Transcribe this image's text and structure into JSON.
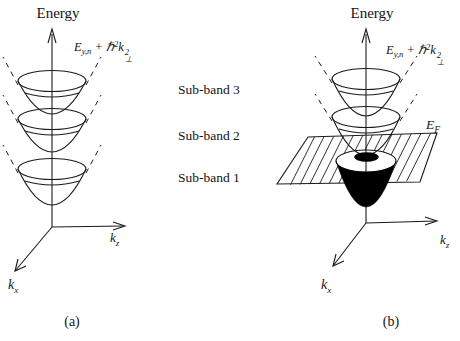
{
  "figure": {
    "axis": {
      "energy": "Energy",
      "k": "k",
      "kz_sub": "z",
      "kx_sub": "x"
    },
    "dispersion_label": {
      "e": "E",
      "e_sub": "y,n",
      "plus": " + ",
      "hbar": "ℏ",
      "hbar_sup": "2",
      "k": "k",
      "k_sup": "2",
      "k_sub": "⊥"
    },
    "fermi": {
      "e": "E",
      "sub": "F"
    },
    "legend": {
      "items": [
        "Sub-band 3",
        "Sub-band 2",
        "Sub-band 1"
      ]
    },
    "captions": {
      "a": "(a)",
      "b": "(b)"
    },
    "colors": {
      "line": "#1a1a1a",
      "filled_band": "#000000",
      "background": "#ffffff"
    }
  }
}
